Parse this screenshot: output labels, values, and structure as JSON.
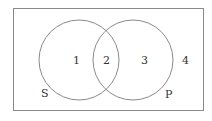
{
  "diagram": {
    "type": "venn",
    "universe": {
      "x": 13,
      "y": 8,
      "width": 190,
      "height": 102
    },
    "sets": [
      {
        "name": "S",
        "label": "S",
        "cx": 79,
        "cy": 60,
        "r": 40,
        "label_x": 24,
        "label_y": 95
      },
      {
        "name": "P",
        "label": "P",
        "cx": 133,
        "cy": 60,
        "r": 40,
        "label_x": 166,
        "label_y": 97
      }
    ],
    "regions": [
      {
        "label": "1",
        "x": 73,
        "y": 64
      },
      {
        "label": "2",
        "x": 106,
        "y": 64
      },
      {
        "label": "3",
        "x": 144,
        "y": 64
      },
      {
        "label": "4",
        "x": 185,
        "y": 64
      }
    ],
    "colors": {
      "stroke": "#8a8a8a",
      "text": "#333333",
      "background": "#ffffff"
    }
  }
}
